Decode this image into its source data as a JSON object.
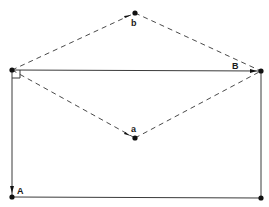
{
  "diagram": {
    "title": "",
    "points": {
      "origin": {
        "x": 12,
        "y": 70
      },
      "top_right": {
        "x": 261,
        "y": 71
      },
      "bottom_left": {
        "x": 12,
        "y": 197
      },
      "bottom_right": {
        "x": 261,
        "y": 198
      },
      "b": {
        "x": 135,
        "y": 13
      },
      "a": {
        "x": 135,
        "y": 138
      }
    },
    "labels": {
      "b": "b",
      "a": "a",
      "B": "B",
      "A": "A"
    },
    "line_color": "#3a3a3a",
    "dash_color": "#4a4a4a",
    "point_color": "#111111",
    "background": "#ffffff"
  }
}
